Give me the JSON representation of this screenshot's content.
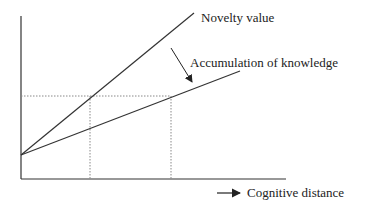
{
  "diagram": {
    "labels": {
      "novelty": "Novelty value",
      "knowledge": "Accumulation of knowledge",
      "xaxis": "Cognitive distance"
    },
    "colors": {
      "line": "#333333",
      "dotted": "#888888"
    }
  }
}
